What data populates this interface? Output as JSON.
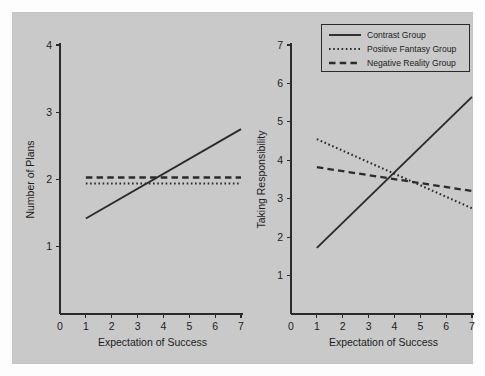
{
  "figure": {
    "background_color": "#fdfdfd",
    "panel_background_color": "#c9c9c9",
    "line_color": "#2b2b2b"
  },
  "legend": {
    "position": "top-right-of-right-panel",
    "entries": [
      {
        "label": "Contrast Group",
        "style": "solid"
      },
      {
        "label": "Positive Fantasy Group",
        "style": "dotted"
      },
      {
        "label": "Negative Reality Group",
        "style": "dashed"
      }
    ]
  },
  "chart_data": [
    {
      "type": "line",
      "panel": "left",
      "title": "",
      "xlabel": "Expectation of Success",
      "ylabel": "Number of Plans",
      "xlim": [
        0,
        7
      ],
      "ylim": [
        0,
        4
      ],
      "xticks": [
        0,
        1,
        2,
        3,
        4,
        5,
        6,
        7
      ],
      "yticks": [
        1,
        2,
        3,
        4
      ],
      "xticklabels": [
        "0",
        "1",
        "2",
        "3",
        "4",
        "5",
        "6",
        "7"
      ],
      "yticklabels": [
        "1",
        "2",
        "3",
        "4"
      ],
      "grid": false,
      "x": [
        1,
        7
      ],
      "series": [
        {
          "name": "Contrast Group",
          "style": "solid",
          "values": [
            1.42,
            2.75
          ]
        },
        {
          "name": "Positive Fantasy Group",
          "style": "dotted",
          "values": [
            1.94,
            1.94
          ]
        },
        {
          "name": "Negative Reality Group",
          "style": "dashed",
          "values": [
            2.03,
            2.03
          ]
        }
      ]
    },
    {
      "type": "line",
      "panel": "right",
      "title": "",
      "xlabel": "Expectation of Success",
      "ylabel": "Taking Responsibility",
      "xlim": [
        0,
        7
      ],
      "ylim": [
        0,
        7
      ],
      "xticks": [
        0,
        1,
        2,
        3,
        4,
        5,
        6,
        7
      ],
      "yticks": [
        1,
        2,
        3,
        4,
        5,
        6,
        7
      ],
      "xticklabels": [
        "0",
        "1",
        "2",
        "3",
        "4",
        "5",
        "6",
        "7"
      ],
      "yticklabels": [
        "1",
        "2",
        "3",
        "4",
        "5",
        "6",
        "7"
      ],
      "grid": false,
      "x": [
        1,
        7
      ],
      "series": [
        {
          "name": "Contrast Group",
          "style": "solid",
          "values": [
            1.72,
            5.65
          ]
        },
        {
          "name": "Positive Fantasy Group",
          "style": "dotted",
          "values": [
            4.55,
            2.75
          ]
        },
        {
          "name": "Negative Reality Group",
          "style": "dashed",
          "values": [
            3.82,
            3.2
          ]
        }
      ]
    }
  ]
}
